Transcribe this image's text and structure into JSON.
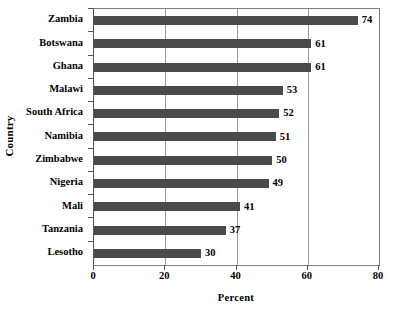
{
  "chart_data": {
    "type": "bar",
    "orientation": "horizontal",
    "title": "",
    "xlabel": "Percent",
    "ylabel": "Country",
    "categories": [
      "Zambia",
      "Botswana",
      "Ghana",
      "Malawi",
      "South Africa",
      "Namibia",
      "Zimbabwe",
      "Nigeria",
      "Mali",
      "Tanzania",
      "Lesotho"
    ],
    "values": [
      74,
      61,
      61,
      53,
      52,
      51,
      50,
      49,
      41,
      37,
      30
    ],
    "value_labels": [
      "74",
      "61",
      "61",
      "53",
      "52",
      "51",
      "50",
      "49",
      "41",
      "37",
      "30"
    ],
    "xlim": [
      0,
      80
    ],
    "ylim": [
      0,
      11
    ],
    "xticks": [
      0,
      20,
      40,
      60,
      80
    ],
    "xtick_labels": [
      "0",
      "20",
      "40",
      "60",
      "80"
    ],
    "grid": true,
    "grid_axis": "x",
    "legend": false,
    "bar_color": "#4a4a4a",
    "plot_border_color": "#808080",
    "gridline_color": "#9a9a9a",
    "background_color": "#ffffff"
  }
}
